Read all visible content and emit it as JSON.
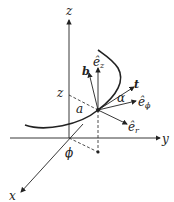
{
  "diagram": {
    "axes": {
      "x": "x",
      "y": "y",
      "z": "z"
    },
    "labels": {
      "z_height": "z",
      "radius": "a",
      "angle_phi": "ϕ",
      "angle_alpha": "α",
      "binormal": "b",
      "tangent": "t",
      "e_z": "ê",
      "e_z_sub": "z",
      "e_phi": "ê",
      "e_phi_sub": "ϕ",
      "e_r": "ê",
      "e_r_sub": "r"
    },
    "colors": {
      "stroke": "#222222",
      "background": "#ffffff"
    }
  }
}
